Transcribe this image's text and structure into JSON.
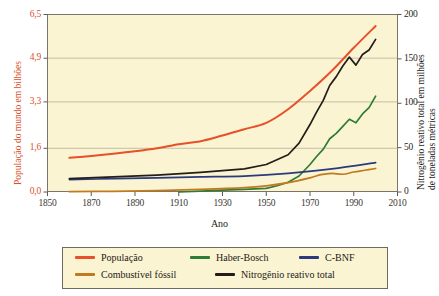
{
  "chart_data": {
    "type": "line",
    "title": "",
    "xlabel": "Ano",
    "ylabel_left": "População do mundo em bilhões",
    "ylabel_right_line1": "Nitrogênio reativo total em milhões",
    "ylabel_right_line2": "de toneladas métricas",
    "xlim": [
      1850,
      2010
    ],
    "xticks": [
      1850,
      1870,
      1890,
      1910,
      1930,
      1950,
      1970,
      1990,
      2010
    ],
    "xticklabels": [
      "1850",
      "1870",
      "1890",
      "1910",
      "1930",
      "1950",
      "1970",
      "1990",
      "2010"
    ],
    "ylim_left": [
      0.0,
      6.5
    ],
    "yticks_left": [
      0.0,
      1.6,
      3.3,
      4.9,
      6.5
    ],
    "yticklabels_left": [
      "0,0",
      "1,6",
      "3,3",
      "4,9",
      "6,5"
    ],
    "ylim_right": [
      0,
      200
    ],
    "yticks_right": [
      0,
      50,
      100,
      150,
      200
    ],
    "yticklabels_right": [
      "0",
      "50",
      "100",
      "150",
      "200"
    ],
    "grid": true,
    "legend_position": "below-axes",
    "plot_background": "#faf4d2",
    "series": [
      {
        "name": "População",
        "axis": "left",
        "color": "#e8502a",
        "x": [
          1860,
          1870,
          1880,
          1890,
          1900,
          1910,
          1920,
          1930,
          1940,
          1950,
          1960,
          1970,
          1980,
          1990,
          2000
        ],
        "values": [
          1.25,
          1.32,
          1.4,
          1.49,
          1.6,
          1.75,
          1.86,
          2.07,
          2.3,
          2.53,
          3.03,
          3.7,
          4.44,
          5.28,
          6.08
        ]
      },
      {
        "name": "Haber-Bosch",
        "axis": "right",
        "color": "#2f7d35",
        "x": [
          1910,
          1920,
          1930,
          1940,
          1950,
          1955,
          1960,
          1965,
          1970,
          1973,
          1976,
          1979,
          1982,
          1985,
          1988,
          1991,
          1994,
          1997,
          2000
        ],
        "values": [
          0,
          1,
          2,
          3,
          4,
          7,
          11,
          18,
          31,
          40,
          48,
          60,
          66,
          74,
          82,
          78,
          88,
          95,
          108
        ]
      },
      {
        "name": "C-BNF",
        "axis": "right",
        "color": "#2a3a7c",
        "x": [
          1860,
          1880,
          1900,
          1920,
          1940,
          1960,
          1980,
          2000
        ],
        "values": [
          14,
          15,
          16,
          17,
          18,
          21,
          26,
          33
        ]
      },
      {
        "name": "Combustível fóssil",
        "axis": "right",
        "color": "#c07a22",
        "x": [
          1860,
          1880,
          1900,
          1920,
          1940,
          1950,
          1960,
          1970,
          1975,
          1980,
          1985,
          1990,
          1995,
          2000
        ],
        "values": [
          0.4,
          0.8,
          1.6,
          3.0,
          5.0,
          7.0,
          10.5,
          16.0,
          19.5,
          21.0,
          20.0,
          22.5,
          24.5,
          26.5
        ]
      },
      {
        "name": "Nitrogênio reativo total",
        "axis": "right",
        "color": "#221d19",
        "x": [
          1860,
          1880,
          1900,
          1920,
          1940,
          1950,
          1960,
          1965,
          1970,
          1973,
          1976,
          1979,
          1982,
          1985,
          1988,
          1991,
          1994,
          1997,
          2000
        ],
        "values": [
          15,
          17,
          19,
          22,
          26,
          31,
          42,
          55,
          76,
          90,
          103,
          120,
          130,
          142,
          152,
          143,
          155,
          160,
          172
        ]
      }
    ]
  },
  "legend": {
    "items": [
      {
        "label": "População",
        "color": "#e8502a"
      },
      {
        "label": "Haber-Bosch",
        "color": "#2f7d35"
      },
      {
        "label": "C-BNF",
        "color": "#2a3a7c"
      },
      {
        "label": "Combustível fóssil",
        "color": "#c07a22"
      },
      {
        "label": "Nitrogênio reativo total",
        "color": "#221d19"
      }
    ]
  }
}
